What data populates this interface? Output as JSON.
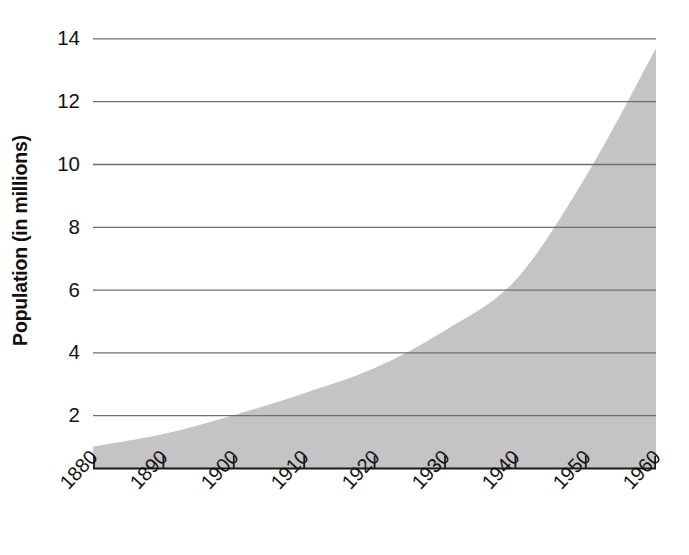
{
  "chart_data": {
    "type": "area",
    "title": "",
    "subtitle": "",
    "xlabel": "",
    "ylabel": "Population (in millions)",
    "x": [
      1880,
      1890,
      1900,
      1910,
      1920,
      1930,
      1940,
      1950,
      1960
    ],
    "values": [
      1.0,
      1.4,
      2.0,
      2.7,
      3.5,
      4.7,
      6.3,
      9.6,
      13.7
    ],
    "series": [
      {
        "name": "Population",
        "values": [
          1.0,
          1.4,
          2.0,
          2.7,
          3.5,
          4.7,
          6.3,
          9.6,
          13.7
        ]
      }
    ],
    "xlim": [
      1880,
      1960
    ],
    "ylim": [
      0.3,
      14.6
    ],
    "x_tick_labels": [
      "1880",
      "1890",
      "1900",
      "1910",
      "1920",
      "1930",
      "1940",
      "1950",
      "1960"
    ],
    "x_ticks": [
      1880,
      1890,
      1900,
      1910,
      1920,
      1930,
      1940,
      1950,
      1960
    ],
    "y_tick_labels": [
      "14",
      "12",
      "10",
      "8",
      "6",
      "4",
      "2"
    ],
    "y_ticks": [
      14,
      12,
      10,
      8,
      6,
      4,
      2
    ],
    "grid": "horizontal",
    "legend": "none",
    "annotations": [],
    "colors": {
      "area_fill": "#c4c4c4",
      "gridline": "#6e6e6e",
      "axis_line": "#1a1a1a",
      "text": "#131313",
      "background": "#ffffff"
    }
  },
  "axes": {
    "y_title": "Population (in millions)"
  }
}
